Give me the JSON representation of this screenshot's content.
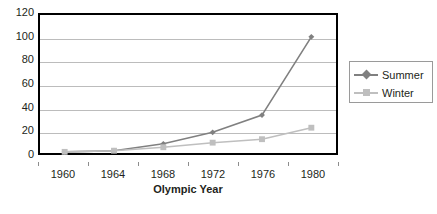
{
  "chart_data": {
    "type": "line",
    "title": "",
    "xlabel": "Olympic Year",
    "ylabel": "",
    "categories": [
      "1960",
      "1964",
      "1968",
      "1972",
      "1976",
      "1980"
    ],
    "x": [
      1960,
      1964,
      1968,
      1972,
      1976,
      1980
    ],
    "series": [
      {
        "name": "Summer",
        "values": [
          1,
          2,
          8,
          18,
          33,
          101
        ],
        "color": "#808080",
        "marker": "diamond"
      },
      {
        "name": "Winter",
        "values": [
          1,
          2,
          5,
          9,
          12,
          22
        ],
        "color": "#bfbfbf",
        "marker": "square"
      }
    ],
    "ylim": [
      0,
      120
    ],
    "y_ticks": [
      "0",
      "20",
      "40",
      "60",
      "80",
      "100",
      "120"
    ],
    "y_tick_values": [
      0,
      20,
      40,
      60,
      80,
      100,
      120
    ],
    "grid": "horizontal",
    "legend_position": "right",
    "legend_entries": [
      "Summer",
      "Winter"
    ],
    "axis_color": "#000000",
    "gridline_color": "#bcbcbc",
    "background_color": "#ffffff"
  },
  "axes": {
    "x_title": "Olympic Year"
  },
  "legend": {
    "items": [
      {
        "label": "Summer"
      },
      {
        "label": "Winter"
      }
    ]
  }
}
